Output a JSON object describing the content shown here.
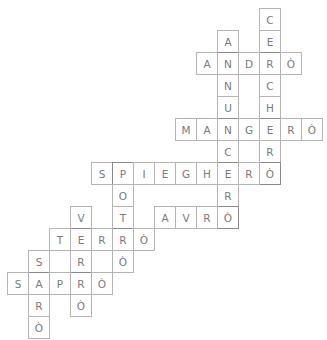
{
  "puzzle": {
    "type": "crossword",
    "words": [
      {
        "id": "cercherò",
        "text": "CERCHERÒ",
        "direction": "down",
        "row": 0,
        "col": 12
      },
      {
        "id": "annuncerò",
        "text": "ANNUNCERÒ",
        "direction": "down",
        "row": 1,
        "col": 10
      },
      {
        "id": "andrò",
        "text": "ANDRÒ",
        "direction": "across",
        "row": 2,
        "col": 9
      },
      {
        "id": "mangerò",
        "text": "MANGERÒ",
        "direction": "across",
        "row": 5,
        "col": 8
      },
      {
        "id": "spiegherò",
        "text": "SPIEGHERÒ",
        "direction": "across",
        "row": 7,
        "col": 4
      },
      {
        "id": "potrò",
        "text": "POTRÒ",
        "direction": "down",
        "row": 7,
        "col": 5
      },
      {
        "id": "avrò",
        "text": "AVRÒ",
        "direction": "across",
        "row": 9,
        "col": 7
      },
      {
        "id": "verrò",
        "text": "VERRÒ",
        "direction": "down",
        "row": 9,
        "col": 3
      },
      {
        "id": "terrò",
        "text": "TERRÒ",
        "direction": "across",
        "row": 10,
        "col": 2
      },
      {
        "id": "sarò",
        "text": "SARÒ",
        "direction": "down",
        "row": 11,
        "col": 1
      },
      {
        "id": "saprò",
        "text": "SAPRÒ",
        "direction": "across",
        "row": 12,
        "col": 0
      }
    ]
  }
}
